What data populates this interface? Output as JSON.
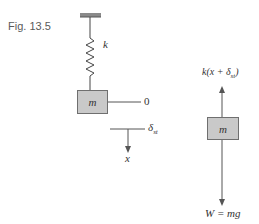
{
  "figure": {
    "label": "Fig. 13.5"
  },
  "left_diagram": {
    "spring_label": "k",
    "mass_label": "m",
    "equilibrium_label": "0",
    "static_deflection_label": "δ",
    "static_deflection_subscript": "st",
    "axis_label": "x"
  },
  "right_diagram": {
    "spring_force_prefix": "k(x + δ",
    "spring_force_subscript": "st",
    "spring_force_suffix": ")",
    "mass_label": "m",
    "weight_label": "W = mg"
  },
  "colors": {
    "line": "#555555",
    "mass_fill": "#c9c9c9",
    "text": "#333333"
  }
}
